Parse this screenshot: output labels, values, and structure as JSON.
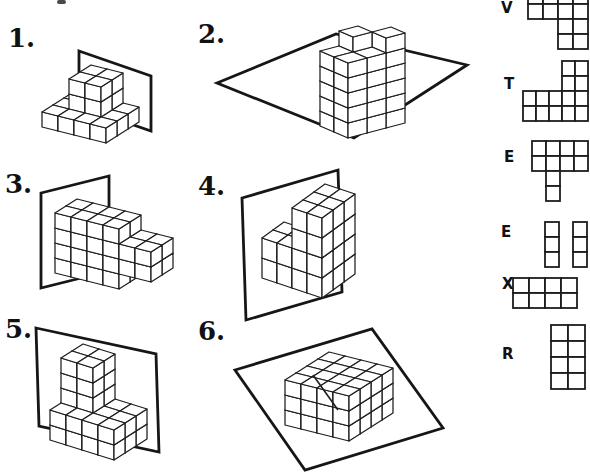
{
  "worksheet": {
    "problems": [
      {
        "number": "1.",
        "figure": {
          "origin": [
            42,
            127
          ],
          "axes": {
            "w": [
              16,
              4
            ],
            "d": [
              11,
              -7
            ],
            "u": [
              0,
              -15
            ]
          },
          "boxes": [
            [
              0,
              3,
              0,
              2,
              0,
              0
            ],
            [
              1,
              2,
              1,
              2,
              1,
              2
            ]
          ],
          "extras": [],
          "plane": [
            [
              79,
              51
            ],
            [
              151,
              76
            ],
            [
              151,
              131
            ],
            [
              79,
              106
            ]
          ],
          "cut_lines": []
        }
      },
      {
        "number": "2.",
        "figure": {
          "origin": [
            320,
            126
          ],
          "axes": {
            "w": [
              14,
              6
            ],
            "d": [
              19,
              -5
            ],
            "u": [
              0,
              -15
            ]
          },
          "boxes": [
            [
              0,
              1,
              0,
              2,
              0,
              4
            ]
          ],
          "extras": [
            [
              0,
              1,
              5
            ],
            [
              1,
              2,
              5
            ]
          ],
          "plane": [
            [
              217,
              83
            ],
            [
              336,
              34
            ],
            [
              467,
              65
            ],
            [
              354,
              138
            ]
          ],
          "cut_lines": []
        }
      },
      {
        "number": "3.",
        "figure": {
          "origin": [
            55,
            273
          ],
          "axes": {
            "w": [
              16,
              4
            ],
            "d": [
              11,
              -7
            ],
            "u": [
              0,
              -15
            ]
          },
          "boxes": [
            [
              0,
              3,
              0,
              1,
              0,
              3
            ],
            [
              4,
              5,
              0,
              1,
              1,
              2
            ]
          ],
          "extras": [],
          "plane": [
            [
              41,
              193
            ],
            [
              109,
              176
            ],
            [
              109,
              271
            ],
            [
              41,
              288
            ]
          ],
          "cut_lines": []
        }
      },
      {
        "number": "4.",
        "figure": {
          "origin": [
            262,
            278
          ],
          "axes": {
            "w": [
              15,
              5
            ],
            "d": [
              11,
              -8
            ],
            "u": [
              0,
              -20
            ]
          },
          "boxes": [
            [
              2,
              3,
              0,
              2,
              0,
              3
            ],
            [
              0,
              1,
              0,
              1,
              0,
              1
            ]
          ],
          "extras": [],
          "plane": [
            [
              242,
              198
            ],
            [
              338,
              170
            ],
            [
              342,
              292
            ],
            [
              246,
              320
            ]
          ],
          "cut_lines": []
        }
      },
      {
        "number": "5.",
        "figure": {
          "origin": [
            50,
            440
          ],
          "axes": {
            "w": [
              16,
              5
            ],
            "d": [
              11,
              -7
            ],
            "u": [
              0,
              -15
            ]
          },
          "boxes": [
            [
              0,
              3,
              0,
              2,
              0,
              1
            ],
            [
              0,
              1,
              1,
              2,
              2,
              4
            ]
          ],
          "extras": [],
          "plane": [
            [
              36,
              328
            ],
            [
              156,
              354
            ],
            [
              159,
              452
            ],
            [
              39,
              426
            ]
          ],
          "cut_lines": []
        }
      },
      {
        "number": "6.",
        "figure": {
          "origin": [
            285,
            425
          ],
          "axes": {
            "w": [
              16,
              4
            ],
            "d": [
              11,
              -7
            ],
            "u": [
              0,
              -15
            ]
          },
          "boxes": [
            [
              0,
              3,
              0,
              3,
              0,
              2
            ]
          ],
          "extras": [],
          "plane": [
            [
              235,
              370
            ],
            [
              372,
              329
            ],
            [
              443,
              428
            ],
            [
              305,
              470
            ]
          ],
          "cut_lines": [
            [
              [
                313,
                375
              ],
              [
                338,
                410
              ]
            ]
          ]
        }
      }
    ],
    "answer_key": [
      {
        "letter": "V",
        "grid": {
          "x": 528,
          "y": -11,
          "cw": 15,
          "ch": 15,
          "cells": [
            [
              0,
              0
            ],
            [
              1,
              0
            ],
            [
              2,
              0
            ],
            [
              3,
              0
            ],
            [
              0,
              1
            ],
            [
              1,
              1
            ],
            [
              2,
              1
            ],
            [
              3,
              1
            ],
            [
              2,
              2
            ],
            [
              3,
              2
            ],
            [
              2,
              3
            ],
            [
              3,
              3
            ]
          ]
        }
      },
      {
        "letter": "T",
        "grid": {
          "x": 523,
          "y": 61,
          "cw": 13,
          "ch": 15,
          "cells": [
            [
              3,
              0
            ],
            [
              4,
              0
            ],
            [
              3,
              1
            ],
            [
              4,
              1
            ],
            [
              0,
              2
            ],
            [
              1,
              2
            ],
            [
              2,
              2
            ],
            [
              3,
              2
            ],
            [
              4,
              2
            ],
            [
              0,
              3
            ],
            [
              1,
              3
            ],
            [
              2,
              3
            ],
            [
              3,
              3
            ],
            [
              4,
              3
            ]
          ]
        }
      },
      {
        "letter": "E",
        "grid": {
          "x": 532,
          "y": 141,
          "cw": 14,
          "ch": 15,
          "cells": [
            [
              0,
              0
            ],
            [
              1,
              0
            ],
            [
              2,
              0
            ],
            [
              3,
              0
            ],
            [
              0,
              1
            ],
            [
              1,
              1
            ],
            [
              2,
              1
            ],
            [
              3,
              1
            ],
            [
              1,
              2
            ],
            [
              1,
              3
            ]
          ]
        }
      },
      {
        "letter": "E",
        "grid": {
          "x": 545,
          "y": 222,
          "cw": 14,
          "ch": 15,
          "cells": [
            [
              0,
              0
            ],
            [
              0,
              1
            ],
            [
              0,
              2
            ],
            [
              2,
              0
            ],
            [
              2,
              1
            ],
            [
              2,
              2
            ]
          ]
        }
      },
      {
        "letter": "X",
        "grid": {
          "x": 513,
          "y": 278,
          "cw": 16,
          "ch": 15,
          "cells": [
            [
              0,
              0
            ],
            [
              1,
              0
            ],
            [
              2,
              0
            ],
            [
              3,
              0
            ],
            [
              0,
              1
            ],
            [
              1,
              1
            ],
            [
              2,
              1
            ],
            [
              3,
              1
            ]
          ]
        }
      },
      {
        "letter": "R",
        "grid": {
          "x": 551,
          "y": 325,
          "cw": 17,
          "ch": 16,
          "cells": [
            [
              0,
              0
            ],
            [
              1,
              0
            ],
            [
              0,
              1
            ],
            [
              1,
              1
            ],
            [
              0,
              2
            ],
            [
              1,
              2
            ],
            [
              0,
              3
            ],
            [
              1,
              3
            ]
          ]
        }
      }
    ]
  }
}
